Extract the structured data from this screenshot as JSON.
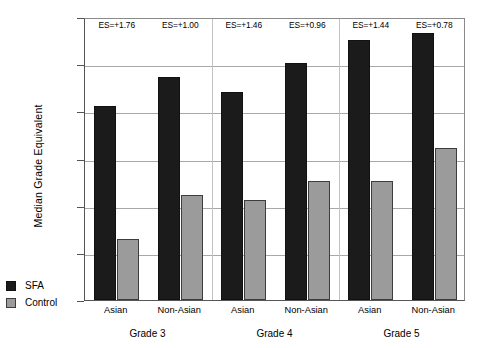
{
  "chart_data": {
    "type": "bar",
    "title": "",
    "xlabel": "",
    "ylabel": "Median Grade Equivalent",
    "ylim": [
      1,
      7
    ],
    "yticks": [
      "1",
      "2",
      "3",
      "4",
      "5",
      "6",
      "7"
    ],
    "grid": true,
    "legend_position": "bottom-left",
    "categories": [
      "Asian",
      "Non-Asian",
      "Asian",
      "Non-Asian",
      "Asian",
      "Non-Asian"
    ],
    "groups": [
      "Grade 3",
      "Grade 4",
      "Grade 5"
    ],
    "series": [
      {
        "name": "SFA",
        "color": "#1b1b1b",
        "values": [
          5.12,
          5.72,
          5.41,
          6.02,
          6.52,
          6.67
        ]
      },
      {
        "name": "Control",
        "color": "#9b9b9b",
        "values": [
          2.3,
          3.22,
          3.12,
          3.53,
          3.53,
          4.23
        ]
      }
    ],
    "annotations": [
      "ES=+1.76",
      "ES=+1.00",
      "ES=+1.46",
      "ES=+0.96",
      "ES=+1.44",
      "ES=+0.78"
    ]
  },
  "legend": {
    "items": [
      {
        "label": "SFA",
        "color": "#1b1b1b"
      },
      {
        "label": "Control",
        "color": "#9b9b9b"
      }
    ]
  }
}
